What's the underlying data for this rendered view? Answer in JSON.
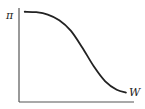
{
  "chart_data": {
    "type": "line",
    "title": "",
    "xlabel": "W",
    "ylabel": "π",
    "x_ticks": [],
    "y_ticks": [],
    "grid": false,
    "legend": "none",
    "xlim": [
      0,
      1
    ],
    "ylim": [
      0,
      1
    ],
    "series": [
      {
        "name": "π(W)",
        "description": "decreasing sigmoid: flat near top, steep drop in middle, levels off near bottom",
        "x": [
          0.05,
          0.15,
          0.25,
          0.35,
          0.45,
          0.55,
          0.65,
          0.75,
          0.85,
          0.93
        ],
        "y": [
          0.96,
          0.955,
          0.93,
          0.87,
          0.76,
          0.58,
          0.38,
          0.22,
          0.13,
          0.1
        ]
      }
    ]
  }
}
